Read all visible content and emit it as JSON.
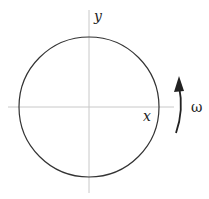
{
  "diagram": {
    "type": "rotating-circle",
    "labels": {
      "x_axis": "x",
      "y_axis": "y",
      "angular_velocity": "ω"
    },
    "circle": {
      "cx": 89,
      "cy": 107,
      "r": 70
    },
    "colors": {
      "circle": "#333333",
      "axes": "#c8c8c8",
      "arrow": "#222222"
    }
  }
}
